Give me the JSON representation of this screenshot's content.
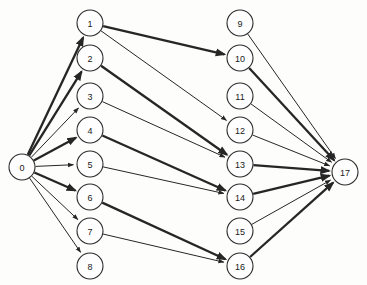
{
  "diagram": {
    "type": "node-link-diagram",
    "canvas": {
      "width": 367,
      "height": 285
    },
    "style": {
      "background_color": "#fdfdfc",
      "node_fill": "#fefefe",
      "node_stroke": "#2b2b2b",
      "edge_color": "#262626",
      "label_color": "#1a1a1a",
      "node_radius": 13
    },
    "nodes": [
      {
        "id": "0",
        "label": "0",
        "x": 22,
        "y": 167,
        "column": "source"
      },
      {
        "id": "1",
        "label": "1",
        "x": 90,
        "y": 23,
        "column": "left"
      },
      {
        "id": "2",
        "label": "2",
        "x": 90,
        "y": 58,
        "column": "left"
      },
      {
        "id": "3",
        "label": "3",
        "x": 90,
        "y": 96,
        "column": "left"
      },
      {
        "id": "4",
        "label": "4",
        "x": 90,
        "y": 130,
        "column": "left"
      },
      {
        "id": "5",
        "label": "5",
        "x": 90,
        "y": 164,
        "column": "left"
      },
      {
        "id": "6",
        "label": "6",
        "x": 90,
        "y": 197,
        "column": "left"
      },
      {
        "id": "7",
        "label": "7",
        "x": 90,
        "y": 231,
        "column": "left"
      },
      {
        "id": "8",
        "label": "8",
        "x": 90,
        "y": 266,
        "column": "left"
      },
      {
        "id": "9",
        "label": "9",
        "x": 240,
        "y": 23,
        "column": "right"
      },
      {
        "id": "10",
        "label": "10",
        "x": 240,
        "y": 58,
        "column": "right"
      },
      {
        "id": "11",
        "label": "11",
        "x": 240,
        "y": 96,
        "column": "right"
      },
      {
        "id": "12",
        "label": "12",
        "x": 240,
        "y": 130,
        "column": "right"
      },
      {
        "id": "13",
        "label": "13",
        "x": 240,
        "y": 164,
        "column": "right"
      },
      {
        "id": "14",
        "label": "14",
        "x": 240,
        "y": 197,
        "column": "right"
      },
      {
        "id": "15",
        "label": "15",
        "x": 240,
        "y": 231,
        "column": "right"
      },
      {
        "id": "16",
        "label": "16",
        "x": 240,
        "y": 266,
        "column": "right"
      },
      {
        "id": "17",
        "label": "17",
        "x": 345,
        "y": 172,
        "column": "sink"
      }
    ],
    "edges": [
      {
        "from": "0",
        "to": "1",
        "weight": "thick"
      },
      {
        "from": "0",
        "to": "2",
        "weight": "thick"
      },
      {
        "from": "0",
        "to": "3",
        "weight": "thin"
      },
      {
        "from": "0",
        "to": "4",
        "weight": "thick"
      },
      {
        "from": "0",
        "to": "5",
        "weight": "thin"
      },
      {
        "from": "0",
        "to": "6",
        "weight": "thick"
      },
      {
        "from": "0",
        "to": "7",
        "weight": "thin"
      },
      {
        "from": "0",
        "to": "8",
        "weight": "thin"
      },
      {
        "from": "1",
        "to": "10",
        "weight": "thick"
      },
      {
        "from": "1",
        "to": "12",
        "weight": "thin"
      },
      {
        "from": "2",
        "to": "13",
        "weight": "thick"
      },
      {
        "from": "3",
        "to": "13",
        "weight": "thin"
      },
      {
        "from": "4",
        "to": "14",
        "weight": "thick"
      },
      {
        "from": "5",
        "to": "14",
        "weight": "thin"
      },
      {
        "from": "6",
        "to": "16",
        "weight": "thick"
      },
      {
        "from": "7",
        "to": "16",
        "weight": "thin"
      },
      {
        "from": "9",
        "to": "17",
        "weight": "thin"
      },
      {
        "from": "10",
        "to": "17",
        "weight": "thick"
      },
      {
        "from": "11",
        "to": "17",
        "weight": "thin"
      },
      {
        "from": "12",
        "to": "17",
        "weight": "thin"
      },
      {
        "from": "13",
        "to": "17",
        "weight": "thick"
      },
      {
        "from": "14",
        "to": "17",
        "weight": "thick"
      },
      {
        "from": "15",
        "to": "17",
        "weight": "thin"
      },
      {
        "from": "16",
        "to": "17",
        "weight": "thick"
      }
    ]
  }
}
